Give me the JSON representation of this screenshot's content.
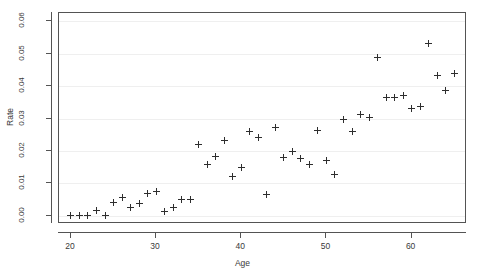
{
  "chart_data": {
    "type": "scatter",
    "title": "",
    "xlabel": "Age",
    "ylabel": "Rate",
    "xlim": [
      18.6,
      66.5
    ],
    "ylim": [
      -0.0025,
      0.0625
    ],
    "xticks": [
      20,
      30,
      40,
      50,
      60
    ],
    "xtick_labels": [
      "20",
      "30",
      "40",
      "50",
      "60"
    ],
    "yticks": [
      0.0,
      0.01,
      0.02,
      0.03,
      0.04,
      0.05,
      0.06
    ],
    "ytick_labels": [
      "0.00",
      "0.01",
      "0.02",
      "0.03",
      "0.04",
      "0.05",
      "0.06"
    ],
    "grid": "horizontal",
    "legend": null,
    "marker": "plus",
    "marker_color": "#2e2e2e",
    "grid_color": "#efefef",
    "frame_color": "#545454",
    "x": [
      20,
      21,
      22,
      23,
      24,
      25,
      26,
      27,
      28,
      29,
      30,
      31,
      32,
      33,
      34,
      35,
      36,
      37,
      38,
      39,
      40,
      41,
      42,
      43,
      44,
      45,
      46,
      47,
      48,
      49,
      50,
      51,
      52,
      53,
      54,
      55,
      56,
      57,
      58,
      59,
      60,
      61,
      62,
      63,
      64,
      65
    ],
    "y": [
      0.0002,
      0.0002,
      0.0002,
      0.0018,
      0.0001,
      0.0042,
      0.0056,
      0.0025,
      0.0039,
      0.0068,
      0.0075,
      0.0015,
      0.0026,
      0.005,
      0.0049,
      0.022,
      0.0158,
      0.0182,
      0.0233,
      0.012,
      0.0149,
      0.0259,
      0.0241,
      0.0067,
      0.0272,
      0.0181,
      0.0199,
      0.0177,
      0.0157,
      0.0264,
      0.0172,
      0.0126,
      0.0298,
      0.026,
      0.0313,
      0.0302,
      0.0488,
      0.0366,
      0.0365,
      0.037,
      0.0331,
      0.0337,
      0.0531,
      0.0434,
      0.0386,
      0.0439
    ]
  }
}
